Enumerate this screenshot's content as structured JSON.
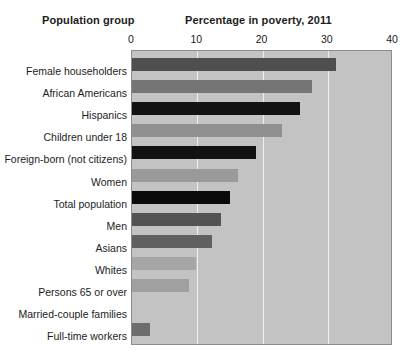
{
  "headers": {
    "category_header": "Population group",
    "value_header": "Percentage in poverty, 2011"
  },
  "chart_data": {
    "type": "bar",
    "orientation": "horizontal",
    "title": "Percentage in poverty, 2011",
    "xlabel": "Percentage in poverty, 2011",
    "ylabel": "Population group",
    "xlim": [
      0,
      40
    ],
    "xticks": [
      0,
      10,
      20,
      30,
      40
    ],
    "tick_labels": [
      "0",
      "10",
      "20",
      "30",
      "40"
    ],
    "grid": true,
    "grid_axis": "x",
    "legend": null,
    "plot_background": "#c3c3c3",
    "gridline_color": "#efefef",
    "categories": [
      "Female householders",
      "African Americans",
      "Hispanics",
      "Children under 18",
      "Foreign-born (not citizens)",
      "Women",
      "Total population",
      "Men",
      "Asians",
      "Whites",
      "Persons 65 or over",
      "Married-couple families",
      "Full-time workers"
    ],
    "values": [
      31.2,
      27.6,
      25.8,
      23.0,
      19.0,
      16.3,
      15.0,
      13.6,
      12.3,
      9.8,
      8.7,
      0,
      2.8
    ],
    "bar_colors": [
      "#4f4f4f",
      "#757575",
      "#121212",
      "#909090",
      "#121212",
      "#9a9a9a",
      "#0a0a0a",
      "#535353",
      "#606060",
      "#a6a6a6",
      "#a0a0a0",
      "#c3c3c3",
      "#6d6d6d"
    ]
  }
}
